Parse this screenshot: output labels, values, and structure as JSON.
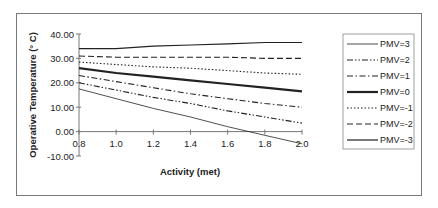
{
  "chart_data": {
    "type": "line",
    "title": "",
    "xlabel": "Activity (met)",
    "ylabel": "Operative Temperature (° C)",
    "x": [
      0.8,
      1.0,
      1.2,
      1.4,
      1.6,
      1.8,
      2.0
    ],
    "xlim": [
      0.8,
      2.0
    ],
    "ylim": [
      -10,
      40
    ],
    "x_ticks": [
      "0.8",
      "1.0",
      "1.2",
      "1.4",
      "1.6",
      "1.8",
      "2.0"
    ],
    "y_ticks": [
      "40.00",
      "30.00",
      "20.00",
      "10.00",
      "0.00",
      "-10.00"
    ],
    "grid": false,
    "legend_position": "right",
    "series": [
      {
        "name": "PMV=3",
        "style": "thin-solid",
        "values": [
          17.5,
          13.5,
          9.5,
          6.0,
          2.0,
          -1.5,
          -5.0
        ]
      },
      {
        "name": "PMV=2",
        "style": "dash-dot-dot",
        "values": [
          20.0,
          17.0,
          14.0,
          11.5,
          8.5,
          6.0,
          3.5
        ]
      },
      {
        "name": "PMV=1",
        "style": "dash-dot",
        "values": [
          23.0,
          20.5,
          18.0,
          15.5,
          13.5,
          11.5,
          10.0
        ]
      },
      {
        "name": "PMV=0",
        "style": "thick-solid",
        "values": [
          26.0,
          24.0,
          22.5,
          21.0,
          19.5,
          18.0,
          16.5
        ]
      },
      {
        "name": "PMV=-1",
        "style": "dotted",
        "values": [
          28.5,
          27.5,
          26.5,
          26.0,
          25.0,
          24.0,
          23.5
        ]
      },
      {
        "name": "PMV=-2",
        "style": "dashed",
        "values": [
          31.0,
          30.5,
          30.5,
          30.5,
          30.5,
          30.0,
          30.0
        ]
      },
      {
        "name": "PMV=-3",
        "style": "solid",
        "values": [
          34.0,
          34.0,
          35.0,
          35.5,
          36.0,
          36.5,
          36.5
        ]
      }
    ]
  }
}
